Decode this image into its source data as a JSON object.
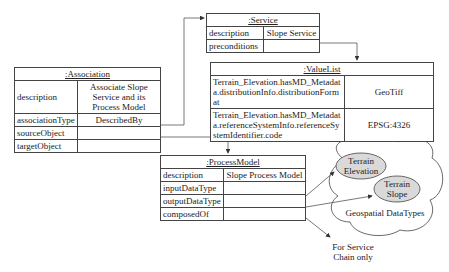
{
  "association": {
    "title": ":Association",
    "rows": [
      {
        "key": "description",
        "value": "Associate Slope Service and its Process Model"
      },
      {
        "key": "associationType",
        "value": "DescribedBy"
      },
      {
        "key": "sourceObject",
        "value": ""
      },
      {
        "key": "targetObject",
        "value": ""
      }
    ]
  },
  "service": {
    "title": ":Service",
    "rows": [
      {
        "key": "description",
        "value": "Slope Service"
      },
      {
        "key": "preconditions",
        "value": ""
      }
    ]
  },
  "valuelist": {
    "title": ":ValueList",
    "rows": [
      {
        "key": "Terrain_Elevation.hasMD_Metadata.distributionInfo.distributionFormat",
        "value": "GeoTiff"
      },
      {
        "key": "Terrain_Elevation.hasMD_Metadata.referenceSystemInfo.referenceSystemIdentifier.code",
        "value": "EPSG:4326"
      }
    ]
  },
  "processmodel": {
    "title": ":ProcessModel",
    "rows": [
      {
        "key": "description",
        "value": "Slope Process Model"
      },
      {
        "key": "inputDataType",
        "value": ""
      },
      {
        "key": "outputDataType",
        "value": ""
      },
      {
        "key": "composedOf",
        "value": ""
      }
    ]
  },
  "cloud": {
    "label": "Geospatial DataTypes",
    "items": [
      {
        "label": "Terrain Elevation",
        "fill": "#d9d9d9"
      },
      {
        "label": "Terrain Slope",
        "fill": "#d9d9d9"
      }
    ]
  },
  "note": {
    "text": "For Service Chain only"
  }
}
